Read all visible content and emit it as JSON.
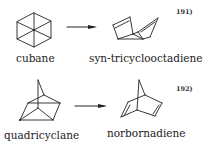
{
  "reactions": [
    {
      "reactant": {
        "name": "cubane",
        "icon": "cubane-structure-icon"
      },
      "product": {
        "name": "syn-tricyclooctadiene",
        "icon": "syn-tricyclooctadiene-structure-icon"
      },
      "arrow": "reaction-arrow-icon",
      "reference": "191)"
    },
    {
      "reactant": {
        "name": "quadricyclane",
        "icon": "quadricyclane-structure-icon"
      },
      "product": {
        "name": "norbornadiene",
        "icon": "norbornadiene-structure-icon"
      },
      "arrow": "reaction-arrow-icon",
      "reference": "192)"
    }
  ],
  "colors": {
    "ink": "#222222",
    "background": "#ffffff"
  }
}
